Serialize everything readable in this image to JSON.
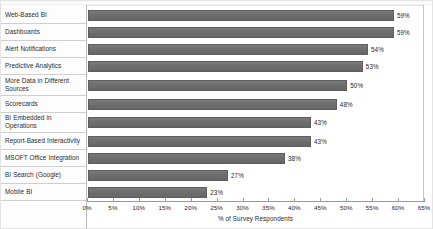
{
  "chart_data": {
    "type": "bar",
    "orientation": "horizontal",
    "title": "",
    "subtitle": "",
    "xlabel": "% of Survey Respondents",
    "ylabel": "",
    "xlim": [
      0,
      65
    ],
    "xtick_step": 5,
    "grid": false,
    "legend": null,
    "bar_color": "#6e6e6e",
    "categories": [
      "Web-Based BI",
      "Dashboards",
      "Alert Notifications",
      "Predictive Analytics",
      "More Data in Different Sources",
      "Scorecards",
      "BI Embedded in Operations",
      "Report-Based Interactivity",
      "MSOFT Office Integration",
      "BI Search (Google)",
      "Mobile BI"
    ],
    "values": [
      59,
      59,
      54,
      53,
      50,
      48,
      43,
      43,
      38,
      27,
      23
    ],
    "value_labels": [
      "59%",
      "59%",
      "54%",
      "53%",
      "50%",
      "48%",
      "43%",
      "43%",
      "38%",
      "27%",
      "23%"
    ],
    "xtick_labels": [
      "0%",
      "5%",
      "10%",
      "15%",
      "20%",
      "25%",
      "30%",
      "35%",
      "40%",
      "45%",
      "50%",
      "55%",
      "60%",
      "65%"
    ],
    "xtick_values": [
      0,
      5,
      10,
      15,
      20,
      25,
      30,
      35,
      40,
      45,
      50,
      55,
      60,
      65
    ]
  },
  "rows": [
    {
      "label": "Web-Based BI",
      "label_lines": [
        "Web-Based BI"
      ],
      "value": 59,
      "value_label": "59%"
    },
    {
      "label": "Dashboards",
      "label_lines": [
        "Dashboards"
      ],
      "value": 59,
      "value_label": "59%"
    },
    {
      "label": "Alert Notifications",
      "label_lines": [
        "Alert Notifications"
      ],
      "value": 54,
      "value_label": "54%"
    },
    {
      "label": "Predictive Analytics",
      "label_lines": [
        "Predictive Analytics"
      ],
      "value": 53,
      "value_label": "53%"
    },
    {
      "label": "More Data in Different Sources",
      "label_lines": [
        "More Data in Different",
        "Sources"
      ],
      "value": 50,
      "value_label": "50%"
    },
    {
      "label": "Scorecards",
      "label_lines": [
        "Scorecards"
      ],
      "value": 48,
      "value_label": "48%"
    },
    {
      "label": "BI Embedded in Operations",
      "label_lines": [
        "BI Embedded in",
        "Operations"
      ],
      "value": 43,
      "value_label": "43%"
    },
    {
      "label": "Report-Based Interactivity",
      "label_lines": [
        "Report-Based Interactivity"
      ],
      "value": 43,
      "value_label": "43%"
    },
    {
      "label": "MSOFT Office Integration",
      "label_lines": [
        "MSOFT Office Integration"
      ],
      "value": 38,
      "value_label": "38%"
    },
    {
      "label": "BI Search (Google)",
      "label_lines": [
        "BI Search (Google)"
      ],
      "value": 27,
      "value_label": "27%"
    },
    {
      "label": "Mobile BI",
      "label_lines": [
        "Mobile BI"
      ],
      "value": 23,
      "value_label": "23%"
    }
  ],
  "axis": {
    "title": "% of Survey Respondents",
    "ticks": [
      "0%",
      "5%",
      "10%",
      "15%",
      "20%",
      "25%",
      "30%",
      "35%",
      "40%",
      "45%",
      "50%",
      "55%",
      "60%",
      "65%"
    ]
  }
}
